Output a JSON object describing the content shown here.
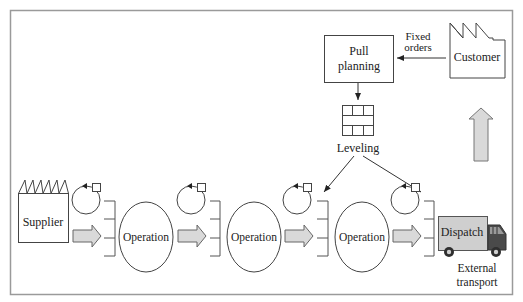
{
  "diagram": {
    "type": "pull-system-flow",
    "colors": {
      "frame": "#9a9a9a",
      "stroke": "#333333",
      "arrow_fill": "#d9d9d9",
      "arrow_stroke": "#666666",
      "truck_box": "#cfcfcf",
      "truck_cab": "#4a4a4a"
    },
    "customer": {
      "label": "Customer"
    },
    "fixed_orders": {
      "line1": "Fixed",
      "line2": "orders"
    },
    "pull_planning": {
      "line1": "Pull",
      "line2": "planning"
    },
    "leveling": {
      "label": "Leveling"
    },
    "supplier": {
      "label": "Supplier"
    },
    "operations": [
      {
        "label": "Operation"
      },
      {
        "label": "Operation"
      },
      {
        "label": "Operation"
      }
    ],
    "dispatch": {
      "label": "Dispatch"
    },
    "external_transport": {
      "line1": "External",
      "line2": "transport"
    }
  }
}
